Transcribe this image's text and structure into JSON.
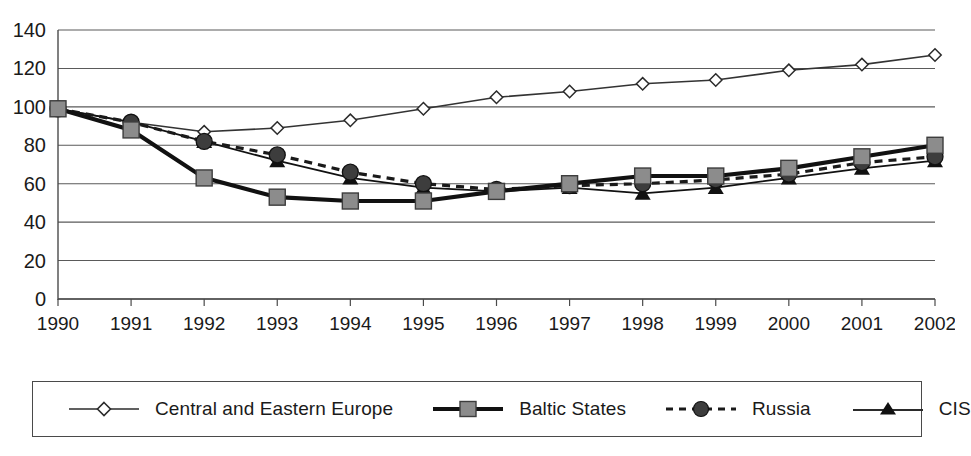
{
  "chart_data": {
    "type": "line",
    "title": "",
    "subtitle": "",
    "xlabel": "",
    "ylabel": "",
    "x": [
      1990,
      1991,
      1992,
      1993,
      1994,
      1995,
      1996,
      1997,
      1998,
      1999,
      2000,
      2001,
      2002
    ],
    "categories": [
      "1990",
      "1991",
      "1992",
      "1993",
      "1994",
      "1995",
      "1996",
      "1997",
      "1998",
      "1999",
      "2000",
      "2001",
      "2002"
    ],
    "ylim": [
      0,
      140
    ],
    "yticks": [
      0,
      20,
      40,
      60,
      80,
      100,
      120,
      140
    ],
    "ytick_labels": [
      "0",
      "20",
      "40",
      "60",
      "80",
      "100",
      "120",
      "140"
    ],
    "grid": "horizontal",
    "legend_position": "bottom",
    "series": [
      {
        "name": "Central and Eastern Europe",
        "marker": "diamond-open",
        "linestyle": "solid-thin",
        "color": "#333333",
        "values": [
          99,
          92,
          87,
          89,
          93,
          99,
          105,
          108,
          112,
          114,
          119,
          122,
          127
        ]
      },
      {
        "name": "Baltic States",
        "marker": "square-filled-gray",
        "linestyle": "solid-thick",
        "color": "#111111",
        "marker_fill": "#8c8c8c",
        "values": [
          99,
          88,
          63,
          53,
          51,
          51,
          56,
          60,
          64,
          64,
          68,
          74,
          80
        ]
      },
      {
        "name": "Russia",
        "marker": "circle-filled",
        "linestyle": "dashed",
        "color": "#1a1a1a",
        "values": [
          99,
          92,
          82,
          75,
          66,
          60,
          57,
          59,
          60,
          62,
          65,
          71,
          74
        ]
      },
      {
        "name": "CIS",
        "marker": "triangle-filled",
        "linestyle": "solid-thin",
        "color": "#111111",
        "values": [
          99,
          92,
          82,
          72,
          63,
          58,
          56,
          58,
          55,
          58,
          63,
          68,
          72
        ]
      }
    ]
  },
  "legend": {
    "items": [
      {
        "label": "Central and Eastern Europe",
        "icon": "diamond-open-line-swatch"
      },
      {
        "label": "Baltic States",
        "icon": "gray-square-thick-line-swatch"
      },
      {
        "label": "Russia",
        "icon": "circle-dashed-line-swatch"
      },
      {
        "label": "CIS",
        "icon": "triangle-line-swatch"
      }
    ]
  },
  "axis": {
    "y_labels": [
      "140",
      "120",
      "100",
      "80",
      "60",
      "40",
      "20",
      "0"
    ],
    "x_labels": [
      "1990",
      "1991",
      "1992",
      "1993",
      "1994",
      "1995",
      "1996",
      "1997",
      "1998",
      "1999",
      "2000",
      "2001",
      "2002"
    ]
  },
  "colors": {
    "axis": "#4a4a4a",
    "grid": "#5a5a5a",
    "text": "#1a1a1a",
    "marker_gray": "#8c8c8c",
    "marker_dark": "#3d3d3d"
  }
}
